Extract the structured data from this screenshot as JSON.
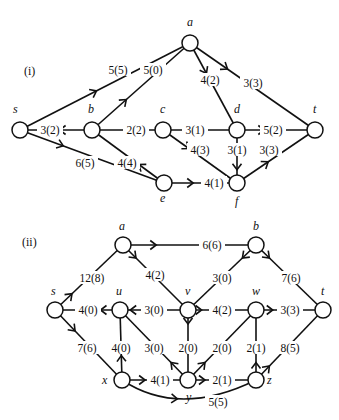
{
  "graphs": [
    {
      "caption": "(i)",
      "caption_pos": [
        24,
        75
      ],
      "nodes": [
        {
          "id": "s",
          "label": "s",
          "x": 20,
          "y": 130,
          "lx": 13,
          "ly": 113
        },
        {
          "id": "a",
          "label": "a",
          "x": 190,
          "y": 43,
          "lx": 187,
          "ly": 26
        },
        {
          "id": "b",
          "label": "b",
          "x": 92,
          "y": 130,
          "lx": 88,
          "ly": 113
        },
        {
          "id": "c",
          "label": "c",
          "x": 163,
          "y": 130,
          "lx": 160,
          "ly": 113
        },
        {
          "id": "d",
          "label": "d",
          "x": 237,
          "y": 130,
          "lx": 234,
          "ly": 113
        },
        {
          "id": "t",
          "label": "t",
          "x": 315,
          "y": 130,
          "lx": 313,
          "ly": 113
        },
        {
          "id": "e",
          "label": "e",
          "x": 164,
          "y": 183,
          "lx": 160,
          "ly": 202
        },
        {
          "id": "f",
          "label": "f",
          "x": 237,
          "y": 183,
          "lx": 235,
          "ly": 205
        }
      ],
      "edges": [
        {
          "from": "s",
          "to": "a",
          "label": "5(5)",
          "lx": 118,
          "ly": 70,
          "arrow": 0.45
        },
        {
          "from": "b",
          "to": "a",
          "label": "5(0)",
          "lx": 153,
          "ly": 70,
          "arrow": 0.35
        },
        {
          "from": "a",
          "to": "d",
          "label": "4(2)",
          "lx": 210,
          "ly": 80,
          "arrow": 0.35
        },
        {
          "from": "a",
          "to": "t",
          "label": "3(3)",
          "lx": 253,
          "ly": 83,
          "arrow": 0.3
        },
        {
          "from": "b",
          "to": "s",
          "label": "3(2)",
          "lx": 50,
          "ly": 130,
          "arrow": 0.45
        },
        {
          "from": "c",
          "to": "b",
          "label": "2(2)",
          "lx": 136,
          "ly": 130,
          "arrow": null
        },
        {
          "from": "d",
          "to": "c",
          "label": "3(1)",
          "lx": 195,
          "ly": 130,
          "arrow": 0.55
        },
        {
          "from": "d",
          "to": "t",
          "label": "5(2)",
          "lx": 273,
          "ly": 130,
          "arrow": 0.35
        },
        {
          "from": "s",
          "to": "e",
          "label": "6(5)",
          "lx": 85,
          "ly": 163,
          "arrow": 0.3
        },
        {
          "from": "e",
          "to": "b",
          "label": "4(4)",
          "lx": 127,
          "ly": 163,
          "arrow": 0.35
        },
        {
          "from": "c",
          "to": "f",
          "label": "4(3)",
          "lx": 200,
          "ly": 150,
          "arrow": 0.35
        },
        {
          "from": "d",
          "to": "f",
          "label": "3(1)",
          "lx": 237,
          "ly": 150,
          "arrow": 0.75
        },
        {
          "from": "f",
          "to": "t",
          "label": "3(3)",
          "lx": 269,
          "ly": 150,
          "arrow": 0.4
        },
        {
          "from": "e",
          "to": "f",
          "label": "4(1)",
          "lx": 214,
          "ly": 183,
          "arrow": 0.4
        }
      ]
    },
    {
      "caption": "(ii)",
      "caption_pos": [
        22,
        246
      ],
      "nodes": [
        {
          "id": "a",
          "label": "a",
          "x": 123,
          "y": 245,
          "lx": 119,
          "ly": 230
        },
        {
          "id": "b",
          "label": "b",
          "x": 256,
          "y": 245,
          "lx": 253,
          "ly": 230
        },
        {
          "id": "s",
          "label": "s",
          "x": 55,
          "y": 310,
          "lx": 51,
          "ly": 295
        },
        {
          "id": "u",
          "label": "u",
          "x": 120,
          "y": 310,
          "lx": 116,
          "ly": 295
        },
        {
          "id": "v",
          "label": "v",
          "x": 188,
          "y": 310,
          "lx": 185,
          "ly": 295
        },
        {
          "id": "w",
          "label": "w",
          "x": 256,
          "y": 310,
          "lx": 252,
          "ly": 295
        },
        {
          "id": "t",
          "label": "t",
          "x": 323,
          "y": 310,
          "lx": 321,
          "ly": 295
        },
        {
          "id": "x",
          "label": "x",
          "x": 122,
          "y": 380,
          "lx": 102,
          "ly": 384
        },
        {
          "id": "y",
          "label": "y",
          "x": 188,
          "y": 380,
          "lx": 186,
          "ly": 401
        },
        {
          "id": "z",
          "label": "z",
          "x": 256,
          "y": 380,
          "lx": 267,
          "ly": 384
        }
      ],
      "edges": [
        {
          "from": "a",
          "to": "b",
          "label": "6(6)",
          "lx": 212,
          "ly": 245,
          "arrow": 0.25
        },
        {
          "from": "s",
          "to": "a",
          "label": "12(8)",
          "lx": 92,
          "ly": 278,
          "arrow": 0.25
        },
        {
          "from": "a",
          "to": "v",
          "label": "4(2)",
          "lx": 155,
          "ly": 275,
          "arrow": 0.2
        },
        {
          "from": "b",
          "to": "v",
          "label": "3(0)",
          "lx": 222,
          "ly": 278,
          "arrow": 0.2
        },
        {
          "from": "b",
          "to": "t",
          "label": "7(6)",
          "lx": 291,
          "ly": 278,
          "arrow": 0.2
        },
        {
          "from": "u",
          "to": "s",
          "label": "4(0)",
          "lx": 88,
          "ly": 310,
          "arrow": 0.3
        },
        {
          "from": "v",
          "to": "u",
          "label": "3(0)",
          "lx": 154,
          "ly": 310,
          "arrow": 0.85
        },
        {
          "from": "v",
          "to": "w",
          "label": "4(2)",
          "lx": 222,
          "ly": 310,
          "arrow": 0.2
        },
        {
          "from": "w",
          "to": "t",
          "label": "3(3)",
          "lx": 290,
          "ly": 310,
          "arrow": 0.25
        },
        {
          "from": "s",
          "to": "x",
          "label": "7(6)",
          "lx": 87,
          "ly": 348,
          "arrow": 0.3
        },
        {
          "from": "x",
          "to": "u",
          "label": "4(0)",
          "lx": 121,
          "ly": 348,
          "arrow": 0.35
        },
        {
          "from": "y",
          "to": "u",
          "label": "3(0)",
          "lx": 154,
          "ly": 348,
          "arrow": 0.25
        },
        {
          "from": "v",
          "to": "y",
          "label": "2(0)",
          "lx": 188,
          "ly": 348,
          "arrow": 0.2
        },
        {
          "from": "y",
          "to": "w",
          "label": "2(0)",
          "lx": 222,
          "ly": 348,
          "arrow": 0.25
        },
        {
          "from": "z",
          "to": "w",
          "label": "2(1)",
          "lx": 256,
          "ly": 348,
          "arrow": 0.25
        },
        {
          "from": "z",
          "to": "t",
          "label": "8(5)",
          "lx": 290,
          "ly": 348,
          "arrow": 0.2
        },
        {
          "from": "x",
          "to": "y",
          "label": "4(1)",
          "lx": 160,
          "ly": 380,
          "arrow": 0.35
        },
        {
          "from": "y",
          "to": "z",
          "label": "2(1)",
          "lx": 222,
          "ly": 380,
          "arrow": 0.25
        },
        {
          "from": "x",
          "to": "z",
          "label": "5(5)",
          "lx": 218,
          "ly": 402,
          "arrow": 0.45,
          "curve": true
        }
      ]
    }
  ],
  "style": {
    "stroke": "#111111",
    "background": "#ffffff",
    "node_radius": 8
  }
}
